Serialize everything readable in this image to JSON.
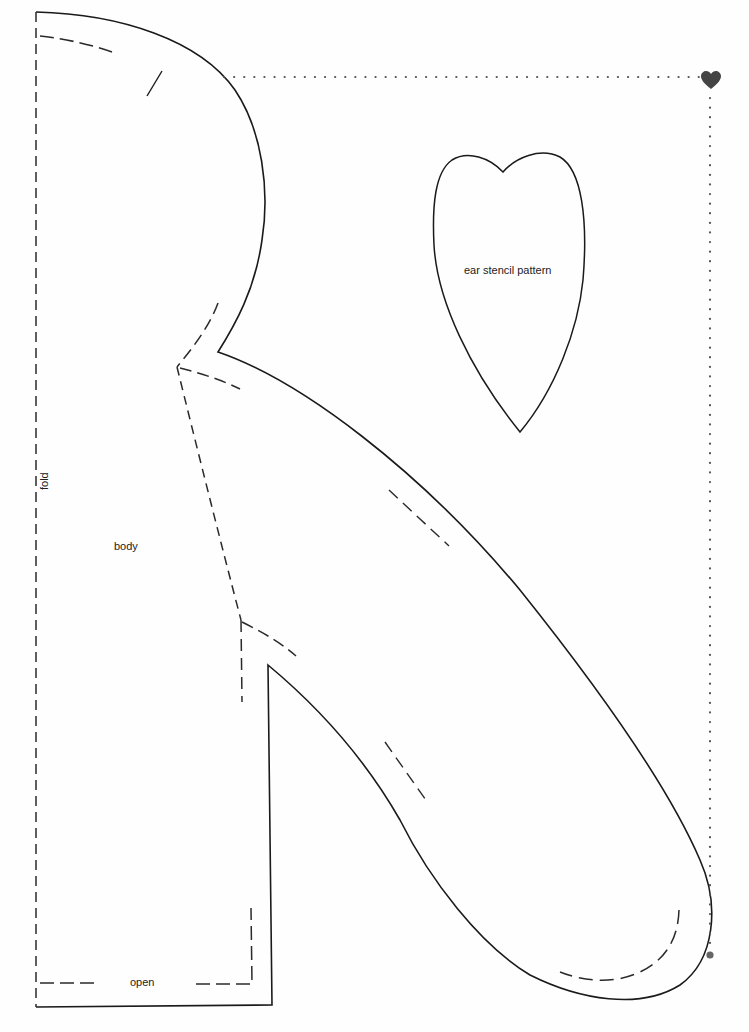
{
  "document": {
    "type": "sewing-pattern",
    "labels": {
      "fold": "fold",
      "body": "body",
      "open": "open",
      "ear": "ear stencil pattern"
    }
  },
  "colors": {
    "background": "#fefefe",
    "outline": "#1a1a1a",
    "dashed": "#2a2a2a",
    "dotted_guide": "#555555",
    "heart_marker": "#444444"
  },
  "icons": {
    "corner_marker": "heart-icon",
    "end_marker": "dot-icon"
  }
}
